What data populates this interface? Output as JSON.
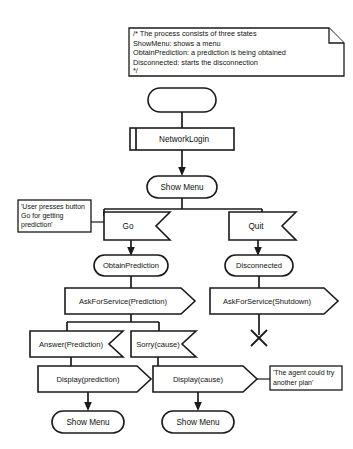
{
  "diagram": {
    "type": "flowchart",
    "comment": {
      "lines": [
        "/* The process consists of three states",
        "ShowMenu: shows a menu",
        "ObtainPrediction: a prediction is being obtained",
        "Disconnected: starts the disconnection",
        "*/"
      ]
    },
    "nodes": {
      "start": {
        "label": "",
        "shape": "stadium"
      },
      "network_login": {
        "label": "NetworkLogin",
        "shape": "subroutine"
      },
      "show_menu_top": {
        "label": "Show Menu",
        "shape": "stadium"
      },
      "go": {
        "label": "Go",
        "shape": "receive-signal"
      },
      "quit": {
        "label": "Quit",
        "shape": "receive-signal"
      },
      "obtain_prediction": {
        "label": "ObtainPrediction",
        "shape": "stadium"
      },
      "disconnected": {
        "label": "Disconnected",
        "shape": "stadium"
      },
      "ask_prediction": {
        "label": "AskForService(Prediction)",
        "shape": "send-signal"
      },
      "ask_shutdown": {
        "label": "AskForService(Shutdown)",
        "shape": "send-signal"
      },
      "answer_prediction": {
        "label": "Answer(Prediction)",
        "shape": "receive-signal"
      },
      "sorry_cause": {
        "label": "Sorry(cause)",
        "shape": "receive-signal"
      },
      "display_prediction": {
        "label": "Display(prediction)",
        "shape": "send-signal"
      },
      "display_cause": {
        "label": "Display(cause)",
        "shape": "send-signal"
      },
      "show_menu_left": {
        "label": "Show Menu",
        "shape": "stadium"
      },
      "show_menu_right": {
        "label": "Show Menu",
        "shape": "stadium"
      },
      "flow_final": {
        "label": "",
        "shape": "x-termination"
      }
    },
    "notes": {
      "user_presses": {
        "lines": [
          "'User presses button",
          "Go for getting",
          "prediction'"
        ]
      },
      "another_plan": {
        "lines": [
          "'The agent could try",
          "another plan'"
        ]
      }
    },
    "colors": {
      "stroke": "#1a1a1a",
      "fill": "#ffffff",
      "background": "#ffffff"
    }
  }
}
